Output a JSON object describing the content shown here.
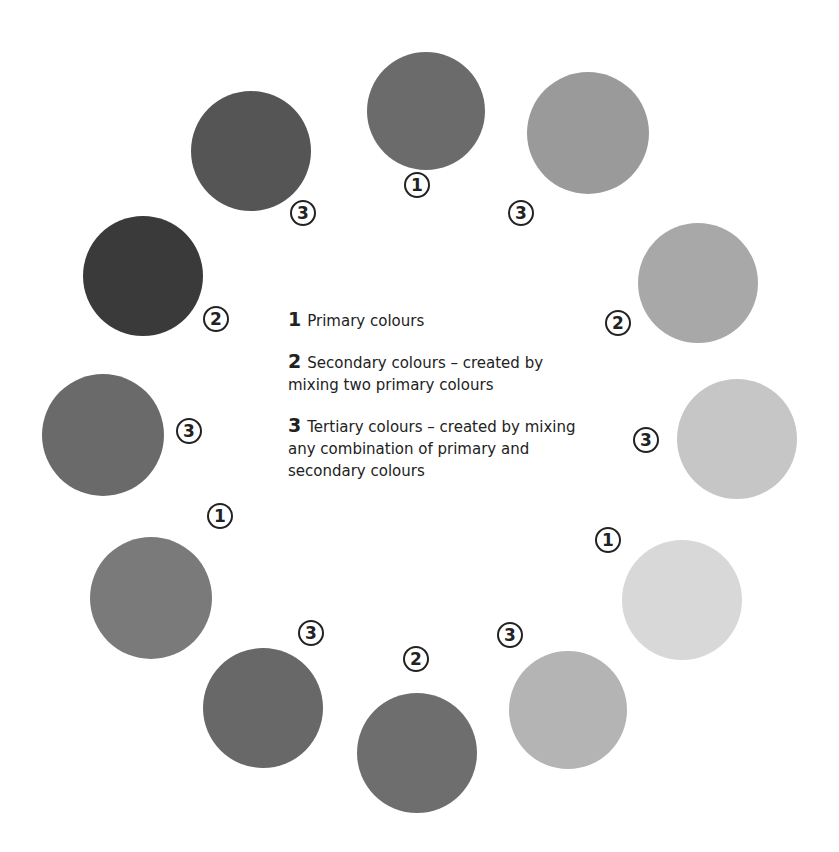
{
  "legend": {
    "items": [
      {
        "num": "1",
        "text": "Primary colours"
      },
      {
        "num": "2",
        "text": "Secondary colours – created by mixing two primary colours"
      },
      {
        "num": "3",
        "text": "Tertiary colours – created by mixing any combination of primary and secondary colours"
      }
    ]
  },
  "wheel": [
    {
      "label": "1",
      "color": "#6b6b6b"
    },
    {
      "label": "3",
      "color": "#9a9a9a"
    },
    {
      "label": "2",
      "color": "#a8a8a8"
    },
    {
      "label": "3",
      "color": "#c6c6c6"
    },
    {
      "label": "1",
      "color": "#d8d8d8"
    },
    {
      "label": "3",
      "color": "#b4b4b4"
    },
    {
      "label": "2",
      "color": "#6e6e6e"
    },
    {
      "label": "3",
      "color": "#686868"
    },
    {
      "label": "1",
      "color": "#7a7a7a"
    },
    {
      "label": "3",
      "color": "#6a6a6a"
    },
    {
      "label": "2",
      "color": "#3a3a3a"
    },
    {
      "label": "3",
      "color": "#555555"
    }
  ]
}
